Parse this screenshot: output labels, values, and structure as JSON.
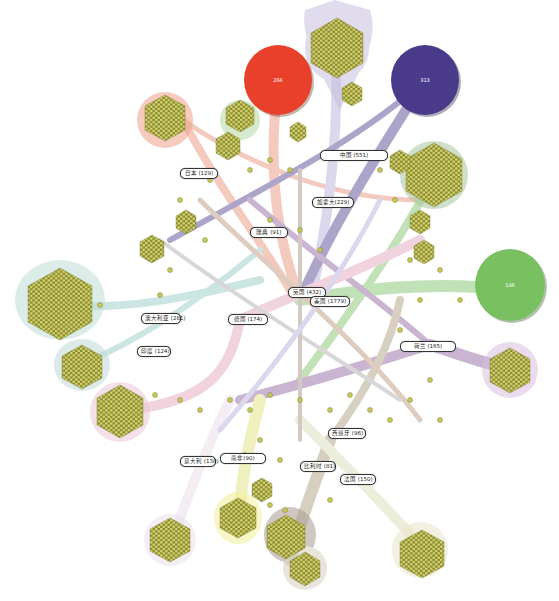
{
  "diagram": {
    "type": "network-infographic",
    "colors": {
      "node_dot": "#c8c85a",
      "red": "#e8402a",
      "indigo": "#4a3a8a",
      "green": "#78c060",
      "purple": "#8a5a9a",
      "pink": "#e0a0b8",
      "teal": "#8ec8c0",
      "olive": "#a89878",
      "salmon": "#e88870",
      "yellow": "#e0e070",
      "lavender": "#b0a8d8"
    },
    "big_circles": [
      {
        "label": "266",
        "color": "red"
      },
      {
        "label": "313",
        "color": "indigo"
      },
      {
        "label": "146",
        "color": "green"
      }
    ],
    "labels": [
      {
        "id": "china",
        "text": "中国 (551)"
      },
      {
        "id": "japan",
        "text": "日本 (129)"
      },
      {
        "id": "canada",
        "text": "加拿大(229)"
      },
      {
        "id": "sweden",
        "text": "瑞典 (91)"
      },
      {
        "id": "uk",
        "text": "英国 (432)"
      },
      {
        "id": "usa",
        "text": "美国 (1779)"
      },
      {
        "id": "australia",
        "text": "澳大利亚 (281)"
      },
      {
        "id": "germany",
        "text": "德国 (174)"
      },
      {
        "id": "india",
        "text": "印度 (124)"
      },
      {
        "id": "netherlands",
        "text": "荷兰 (165)"
      },
      {
        "id": "spain",
        "text": "西班牙 (96)"
      },
      {
        "id": "italy",
        "text": "意大利 (138)"
      },
      {
        "id": "southafrica",
        "text": "南非(90)"
      },
      {
        "id": "belgium",
        "text": "比利时 (81)"
      },
      {
        "id": "france",
        "text": "法国 (150)"
      }
    ]
  }
}
